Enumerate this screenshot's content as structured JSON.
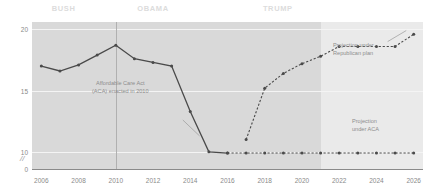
{
  "chart_data": {
    "type": "line",
    "title": "",
    "xlabel": "",
    "ylabel": "",
    "x": [
      2006,
      2007,
      2008,
      2009,
      2010,
      2011,
      2012,
      2013,
      2014,
      2015,
      2016,
      2017,
      2018,
      2019,
      2020,
      2021,
      2022,
      2023,
      2024,
      2025,
      2026
    ],
    "xlim": [
      2005.5,
      2026.5
    ],
    "ylim": [
      8.6,
      20.6
    ],
    "yticks": [
      10,
      15,
      20
    ],
    "ytick_labels": [
      "10",
      "15",
      "20"
    ],
    "y_axis_zero_label": "0",
    "axis_break": true,
    "grid": true,
    "legend_position": "inline-annotations",
    "xticks": [
      2006,
      2008,
      2010,
      2012,
      2014,
      2016,
      2018,
      2020,
      2022,
      2024,
      2026
    ],
    "xtick_labels": [
      "2006",
      "2008",
      "2010",
      "2012",
      "2014",
      "2016",
      "2018",
      "2020",
      "2022",
      "2024",
      "2026"
    ],
    "series": [
      {
        "name": "Historical uninsured",
        "style": "solid",
        "x": [
          2006,
          2007,
          2008,
          2009,
          2010,
          2011,
          2012,
          2013,
          2014,
          2015,
          2016
        ],
        "values": [
          17.0,
          16.6,
          17.1,
          17.9,
          18.7,
          17.6,
          17.3,
          17.0,
          13.3,
          10.0,
          9.9
        ]
      },
      {
        "name": "Projection under Republican plan",
        "style": "dashed",
        "x": [
          2017,
          2018,
          2019,
          2020,
          2021,
          2022,
          2023,
          2024,
          2025,
          2026
        ],
        "values": [
          11.0,
          15.2,
          16.4,
          17.2,
          17.8,
          18.6,
          18.6,
          18.6,
          18.6,
          19.6
        ]
      },
      {
        "name": "Projection under ACA",
        "style": "dashed",
        "x": [
          2016,
          2017,
          2018,
          2019,
          2020,
          2021,
          2022,
          2023,
          2024,
          2025,
          2026
        ],
        "values": [
          9.9,
          9.9,
          9.9,
          9.9,
          9.9,
          9.9,
          9.9,
          9.9,
          9.9,
          9.9,
          9.9
        ]
      }
    ],
    "eras": [
      {
        "label": "BUSH",
        "center_year": 2007.2
      },
      {
        "label": "OBAMA",
        "center_year": 2012.0
      },
      {
        "label": "TRUMP",
        "center_year": 2018.7
      }
    ],
    "annotations": [
      {
        "name": "aca-enacted",
        "text": "Affordable Care Act\n(ACA) enacted in 2010"
      },
      {
        "name": "republican-projection",
        "text": "Projection under\nRepublican plan"
      },
      {
        "name": "aca-projection",
        "text": "Projection\nunder ACA"
      }
    ],
    "marker_event_year": 2010,
    "shade_start_year": 2021,
    "colors": {
      "plot_background": "#d9d9d9",
      "shade_background": "#eaeaea",
      "line": "#4a4a4a",
      "gridline": "#f4f4f4",
      "text": "#8a8a8a",
      "era_label": "#dcdcdc"
    }
  }
}
